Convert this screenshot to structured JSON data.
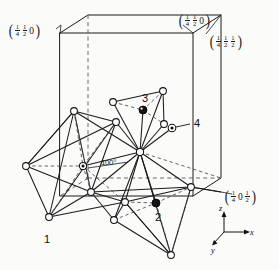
{
  "figure": {
    "background_color": "#fbfbfa",
    "line_color": "#1a1a1a"
  },
  "coordinate_labels": [
    {
      "id": "label-top-left",
      "name": "coord-label-quarter-half-zero",
      "terms": [
        "1/4",
        "1/2",
        "0"
      ],
      "display": "(¼ ½ 0)",
      "x": 8,
      "y": 22
    },
    {
      "id": "label-top-right",
      "name": "coord-label-quarter-half-zero-2",
      "terms": [
        "1/4",
        "1/2",
        "0"
      ],
      "display": "(¼ ½ 0)",
      "x": 178,
      "y": 12
    },
    {
      "id": "label-right-upper",
      "name": "coord-label-quarter-half-half",
      "terms": [
        "1/4",
        "1/2",
        "1/2"
      ],
      "display": "(¼ ½ ½)",
      "x": 209,
      "y": 33
    },
    {
      "id": "label-right-lower",
      "name": "coord-label-quarter-zero-half",
      "terms": [
        "1/4",
        "0",
        "1/2"
      ],
      "display": "(¼ 0 ½)",
      "x": 224,
      "y": 188
    }
  ],
  "atom_labels": [
    {
      "id": "atom-1",
      "text": "1",
      "x": 44,
      "y": 240,
      "marker": "open-circle"
    },
    {
      "id": "atom-2",
      "text": "2",
      "x": 155,
      "y": 218,
      "marker": "filled-circle"
    },
    {
      "id": "atom-3",
      "text": "3",
      "x": 142,
      "y": 97,
      "marker": "filled-circle"
    },
    {
      "id": "atom-4",
      "text": "4",
      "x": 194,
      "y": 122,
      "marker": "dotted-circle"
    }
  ],
  "angle_annotation": {
    "id": "angle-100",
    "text": "100°",
    "x": 101,
    "y": 161
  },
  "axes": [
    {
      "id": "axis-z",
      "label": "z",
      "x": 222,
      "y": 208,
      "direction": "up"
    },
    {
      "id": "axis-x",
      "label": "x",
      "x": 250,
      "y": 229,
      "direction": "right"
    },
    {
      "id": "axis-y",
      "label": "y",
      "x": 216,
      "y": 244,
      "direction": "lower-left"
    }
  ],
  "unit_cell": {
    "name": "unit-cell-box",
    "description": "Orthorhombic unit cell outline drawn in oblique projection",
    "solid_edges": [
      [
        60,
        33,
        193,
        33
      ],
      [
        60,
        33,
        60,
        196
      ],
      [
        193,
        33,
        193,
        196
      ],
      [
        60,
        196,
        193,
        196
      ],
      [
        60,
        33,
        88,
        15
      ],
      [
        193,
        33,
        221,
        15
      ],
      [
        88,
        15,
        221,
        15
      ],
      [
        221,
        15,
        221,
        178
      ],
      [
        193,
        196,
        221,
        178
      ]
    ],
    "dashed_edges": [
      [
        88,
        15,
        88,
        178
      ],
      [
        88,
        178,
        221,
        178
      ],
      [
        88,
        178,
        60,
        196
      ]
    ]
  },
  "polyhedra": {
    "description": "Three edge-linked coordination polyhedra with open-circle oxygen vertices and central cation hubs",
    "vertices": [
      {
        "id": "v1",
        "x": 74,
        "y": 111,
        "type": "open"
      },
      {
        "id": "v2",
        "x": 116,
        "y": 122,
        "type": "open"
      },
      {
        "id": "v3",
        "x": 26,
        "y": 166,
        "type": "open"
      },
      {
        "id": "v4",
        "x": 91,
        "y": 192,
        "type": "open"
      },
      {
        "id": "v5",
        "x": 49,
        "y": 217,
        "type": "open"
      },
      {
        "id": "v6",
        "x": 83,
        "y": 166,
        "type": "dotted"
      },
      {
        "id": "v7",
        "x": 114,
        "y": 220,
        "type": "open"
      },
      {
        "id": "v8",
        "x": 113,
        "y": 102,
        "type": "open"
      },
      {
        "id": "v9",
        "x": 163,
        "y": 91,
        "type": "open"
      },
      {
        "id": "v10",
        "x": 164,
        "y": 124,
        "type": "open"
      },
      {
        "id": "v11",
        "x": 140,
        "y": 152,
        "type": "hub"
      },
      {
        "id": "v12",
        "x": 191,
        "y": 187,
        "type": "open"
      },
      {
        "id": "v13",
        "x": 125,
        "y": 202,
        "type": "open"
      },
      {
        "id": "v14",
        "x": 171,
        "y": 255,
        "type": "open"
      },
      {
        "id": "v15",
        "x": 143,
        "y": 110,
        "type": "filled"
      },
      {
        "id": "v16",
        "x": 156,
        "y": 203,
        "type": "filled"
      },
      {
        "id": "v17",
        "x": 172,
        "y": 128,
        "type": "dotted"
      }
    ]
  }
}
